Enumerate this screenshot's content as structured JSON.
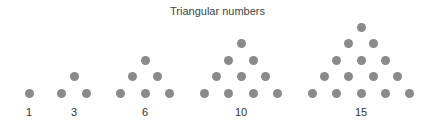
{
  "title": "Triangular numbers",
  "dot_color": "#8a8a8a",
  "groups": [
    {
      "label": "1",
      "rows": 1,
      "center_x": 29
    },
    {
      "label": "3",
      "rows": 2,
      "center_x": 74
    },
    {
      "label": "6",
      "rows": 3,
      "center_x": 145
    },
    {
      "label": "10",
      "rows": 4,
      "center_x": 241
    },
    {
      "label": "15",
      "rows": 5,
      "center_x": 361
    }
  ]
}
